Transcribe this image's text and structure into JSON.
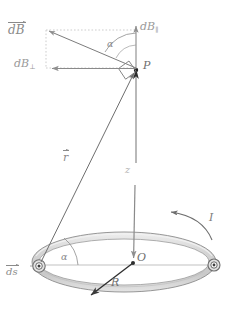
{
  "figure": {
    "topic": "Biot-Savart law for a circular loop",
    "background_color": "#ffffff",
    "line_color": "#7a7a7a",
    "label_color": "#8a8a8a",
    "ring_fill_color": "#d9d9d9",
    "ring_edge_color": "#8c8c8c",
    "dotted_color": "#bdbdbd"
  },
  "labels": {
    "dB_vector": "dB",
    "dB_parallel": "dB",
    "dB_parallel_sub": "∥",
    "dB_perpendicular": "dB",
    "dB_perpendicular_sub": "⊥",
    "alpha_top": "α",
    "alpha_loop": "α",
    "point_P": "P",
    "point_O": "O",
    "radius_R": "R",
    "axis_z": "z",
    "r_vector": "r",
    "ds_vector": "ds",
    "current_I": "I"
  },
  "geometry": {
    "point_P": {
      "x": 136,
      "y": 70
    },
    "point_O": {
      "x": 133,
      "y": 263
    },
    "loop_center": {
      "x": 124,
      "y": 262
    },
    "loop_rx": 92,
    "loop_ry": 30,
    "ds_element": {
      "x": 39,
      "y": 266
    },
    "ds_element_right": {
      "x": 214,
      "y": 265
    },
    "radius_tip": {
      "x": 89,
      "y": 297
    },
    "dB_tip": {
      "x": 46,
      "y": 30
    },
    "dB_parallel_tip": {
      "x": 136,
      "y": 28
    },
    "dB_perp_tip": {
      "x": 50,
      "y": 68
    }
  },
  "elements": {
    "markers": [
      {
        "name": "current-element-left",
        "type": "circled-dot"
      },
      {
        "name": "current-element-right",
        "type": "circled-dot"
      }
    ],
    "right_angle_marker": true,
    "dotted_construction_rectangle": true,
    "current_direction": "counterclockwise"
  }
}
